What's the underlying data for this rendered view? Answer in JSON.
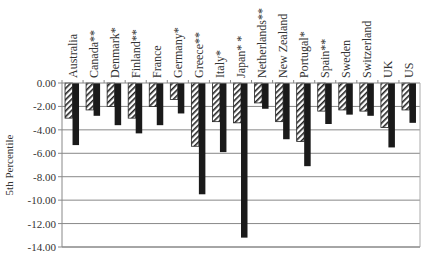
{
  "chart_data": {
    "type": "bar",
    "title": "",
    "xlabel": "",
    "ylabel": "5th Percentile",
    "ylim": [
      -14,
      0
    ],
    "yticks": [
      "0.00",
      "-2.00",
      "-4.00",
      "-6.00",
      "-8.00",
      "-10.00",
      "-12.00",
      "-14.00"
    ],
    "grid": true,
    "legend": "none",
    "categories": [
      "Australia",
      "Canada**",
      "Denmark*",
      "Finland**",
      "France",
      "Germany*",
      "Greece**",
      "Italy*",
      "Japan* *",
      "Netherlands**",
      "New Zealand",
      "Portugal*",
      "Spain**",
      "Sweden",
      "Switzerland",
      "UK",
      "US"
    ],
    "series": [
      {
        "name": "hatched",
        "pattern": "diagonal-hatch",
        "values": [
          -3.0,
          -2.3,
          -2.0,
          -3.0,
          -2.0,
          -1.4,
          -5.4,
          -3.3,
          -3.4,
          -1.7,
          -3.3,
          -5.0,
          -2.4,
          -2.3,
          -2.4,
          -3.8,
          -2.3
        ]
      },
      {
        "name": "solid",
        "pattern": "solid-black",
        "values": [
          -5.3,
          -2.8,
          -3.6,
          -4.3,
          -3.6,
          -2.6,
          -9.5,
          -5.9,
          -13.2,
          -2.2,
          -4.8,
          -7.1,
          -3.5,
          -2.7,
          -2.8,
          -5.5,
          -3.4
        ]
      }
    ],
    "colors": {
      "solid": "#1a1a1a",
      "hatch": "#222222",
      "grid": "#888888",
      "axis": "#888888",
      "text": "#333333"
    }
  }
}
